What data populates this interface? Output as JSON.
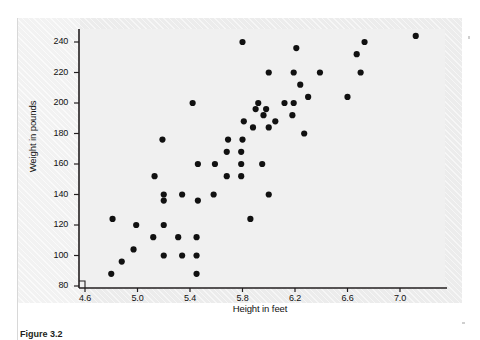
{
  "figure": {
    "caption": "Figure 3.2",
    "background_color": "#ececec",
    "plot_background_color": "#f0f0f0",
    "axis_color": "#231f20",
    "point_color": "#111111"
  },
  "chart_data": {
    "type": "scatter",
    "title": "",
    "xlabel": "Height in feet",
    "ylabel": "Weight in pounds",
    "xlim": [
      4.6,
      7.22
    ],
    "ylim": [
      80,
      248
    ],
    "xticks": [
      4.6,
      5.0,
      5.4,
      5.8,
      6.2,
      6.6,
      7.0
    ],
    "xtick_labels": [
      "4.6",
      "5.0",
      "5.4",
      "5.8",
      "6.2",
      "6.6",
      "7.0"
    ],
    "yticks": [
      80,
      100,
      120,
      140,
      160,
      180,
      200,
      220,
      240
    ],
    "ytick_labels": [
      "80",
      "100",
      "120",
      "140",
      "160",
      "180",
      "200",
      "220",
      "240"
    ],
    "grid": false,
    "legend": null,
    "marker": "filled-circle",
    "marker_size": 5,
    "n_points": 63,
    "points": [
      {
        "x": 4.8,
        "y": 88
      },
      {
        "x": 4.88,
        "y": 96
      },
      {
        "x": 4.81,
        "y": 124
      },
      {
        "x": 4.97,
        "y": 104
      },
      {
        "x": 4.99,
        "y": 120
      },
      {
        "x": 5.12,
        "y": 112
      },
      {
        "x": 5.13,
        "y": 152
      },
      {
        "x": 5.2,
        "y": 100
      },
      {
        "x": 5.2,
        "y": 120
      },
      {
        "x": 5.2,
        "y": 136
      },
      {
        "x": 5.2,
        "y": 140
      },
      {
        "x": 5.19,
        "y": 176
      },
      {
        "x": 5.31,
        "y": 112
      },
      {
        "x": 5.34,
        "y": 100
      },
      {
        "x": 5.34,
        "y": 140
      },
      {
        "x": 5.42,
        "y": 200
      },
      {
        "x": 5.45,
        "y": 88
      },
      {
        "x": 5.45,
        "y": 100
      },
      {
        "x": 5.45,
        "y": 112
      },
      {
        "x": 5.46,
        "y": 136
      },
      {
        "x": 5.46,
        "y": 160
      },
      {
        "x": 5.58,
        "y": 140
      },
      {
        "x": 5.59,
        "y": 160
      },
      {
        "x": 5.68,
        "y": 152
      },
      {
        "x": 5.68,
        "y": 168
      },
      {
        "x": 5.69,
        "y": 176
      },
      {
        "x": 5.79,
        "y": 152
      },
      {
        "x": 5.79,
        "y": 160
      },
      {
        "x": 5.79,
        "y": 168
      },
      {
        "x": 5.8,
        "y": 176
      },
      {
        "x": 5.81,
        "y": 188
      },
      {
        "x": 5.8,
        "y": 240
      },
      {
        "x": 5.86,
        "y": 124
      },
      {
        "x": 5.88,
        "y": 184
      },
      {
        "x": 5.9,
        "y": 196
      },
      {
        "x": 5.92,
        "y": 200
      },
      {
        "x": 5.95,
        "y": 160
      },
      {
        "x": 5.96,
        "y": 192
      },
      {
        "x": 5.98,
        "y": 196
      },
      {
        "x": 6.0,
        "y": 140
      },
      {
        "x": 6.0,
        "y": 184
      },
      {
        "x": 6.0,
        "y": 220
      },
      {
        "x": 6.05,
        "y": 188
      },
      {
        "x": 6.12,
        "y": 200
      },
      {
        "x": 6.18,
        "y": 192
      },
      {
        "x": 6.19,
        "y": 200
      },
      {
        "x": 6.19,
        "y": 220
      },
      {
        "x": 6.21,
        "y": 236
      },
      {
        "x": 6.24,
        "y": 212
      },
      {
        "x": 6.27,
        "y": 180
      },
      {
        "x": 6.3,
        "y": 204
      },
      {
        "x": 6.39,
        "y": 220
      },
      {
        "x": 6.6,
        "y": 204
      },
      {
        "x": 6.67,
        "y": 232
      },
      {
        "x": 6.7,
        "y": 220
      },
      {
        "x": 6.73,
        "y": 240
      },
      {
        "x": 7.12,
        "y": 244
      }
    ]
  }
}
